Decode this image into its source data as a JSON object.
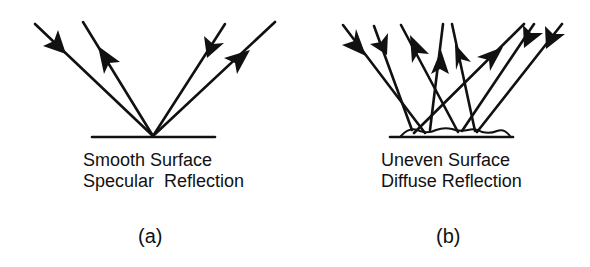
{
  "panels": [
    {
      "id": "a",
      "surface_label": "Smooth Surface",
      "reflection_label": "Specular  Reflection",
      "caption": "(a)"
    },
    {
      "id": "b",
      "surface_label": "Uneven Surface",
      "reflection_label": "Diffuse Reflection",
      "caption": "(b)"
    }
  ],
  "colors": {
    "ink": "#111111",
    "background": "#ffffff"
  }
}
